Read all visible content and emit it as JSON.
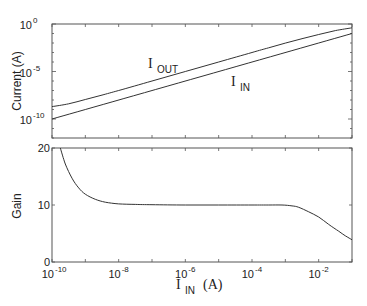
{
  "chart_data": [
    {
      "type": "line",
      "title": "",
      "xlabel_main": "I",
      "xlabel_sub": "",
      "ylabel": "Current (A)",
      "xscale": "log",
      "yscale": "log",
      "xlim_log10": [
        -10,
        -1
      ],
      "ylim_log10": [
        -12,
        0
      ],
      "yticks": [
        {
          "base": "10",
          "exp": "0",
          "v": 0
        },
        {
          "base": "10",
          "exp": "-5",
          "v": -5
        },
        {
          "base": "10",
          "exp": "-10",
          "v": -10
        }
      ],
      "series": [
        {
          "name": "I_OUT",
          "label_main": "I",
          "label_sub": "OUT",
          "x_log10": [
            -10,
            -9.5,
            -9,
            -8.5,
            -8,
            -7,
            -6,
            -5,
            -4,
            -3.5,
            -3,
            -2.5,
            -2,
            -1.5,
            -1
          ],
          "y_log10": [
            -8.7,
            -8.4,
            -7.95,
            -7.48,
            -7.0,
            -6.0,
            -5.0,
            -4.0,
            -3.0,
            -2.5,
            -2.01,
            -1.55,
            -1.1,
            -0.7,
            -0.4
          ]
        },
        {
          "name": "I_IN",
          "label_main": "I",
          "label_sub": "IN",
          "x_log10": [
            -10,
            -1
          ],
          "y_log10": [
            -10,
            -1
          ]
        }
      ]
    },
    {
      "type": "line",
      "title": "",
      "xlabel_main": "I",
      "xlabel_sub": "IN",
      "xlabel_unit": "(A)",
      "ylabel": "Gain",
      "xscale": "log",
      "xlim_log10": [
        -10,
        -1
      ],
      "ylim": [
        0,
        20
      ],
      "yticks": [
        0,
        10,
        20
      ],
      "xticks": [
        {
          "base": "10",
          "exp": "-10",
          "v": -10
        },
        {
          "base": "10",
          "exp": "-8",
          "v": -8
        },
        {
          "base": "10",
          "exp": "-6",
          "v": -6
        },
        {
          "base": "10",
          "exp": "-4",
          "v": -4
        },
        {
          "base": "10",
          "exp": "-2",
          "v": -2
        }
      ],
      "series": [
        {
          "name": "Gain",
          "x_log10": [
            -9.75,
            -9.6,
            -9.4,
            -9.2,
            -9.0,
            -8.7,
            -8.4,
            -8.0,
            -7.5,
            -7,
            -6,
            -5,
            -4,
            -3.5,
            -3.1,
            -2.8,
            -2.6,
            -2.3,
            -2.0,
            -1.7,
            -1.4,
            -1.2,
            -1.0
          ],
          "y": [
            20,
            17.2,
            14.7,
            13.0,
            11.9,
            11.0,
            10.5,
            10.2,
            10.1,
            10.05,
            10.0,
            10.0,
            10.0,
            10.0,
            10.0,
            9.85,
            9.6,
            8.8,
            7.9,
            6.6,
            5.4,
            4.6,
            3.9
          ]
        }
      ]
    }
  ]
}
